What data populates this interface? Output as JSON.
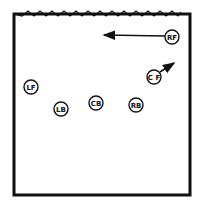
{
  "diagram": {
    "colors": {
      "line": "#111111",
      "background": "#ffffff"
    },
    "court": {
      "x": 14,
      "y": 14,
      "width": 176,
      "height": 181
    },
    "net": {
      "y": 14,
      "style": "zigzag"
    },
    "players": [
      {
        "id": "RF",
        "label": "RF",
        "x": 172,
        "y": 37
      },
      {
        "id": "CF",
        "label": "C F",
        "x": 154,
        "y": 77
      },
      {
        "id": "LF",
        "label": "LF",
        "x": 31,
        "y": 87
      },
      {
        "id": "LB",
        "label": "LB",
        "x": 61,
        "y": 109
      },
      {
        "id": "CB",
        "label": "CB",
        "x": 96,
        "y": 103
      },
      {
        "id": "RB",
        "label": "RB",
        "x": 136,
        "y": 105
      }
    ],
    "arrows": [
      {
        "from": "RF",
        "x1": 165,
        "y1": 36,
        "x2": 104,
        "y2": 35,
        "direction": "left"
      },
      {
        "from": "CF",
        "x1": 160,
        "y1": 72,
        "x2": 174,
        "y2": 63,
        "direction": "up-right"
      }
    ]
  }
}
